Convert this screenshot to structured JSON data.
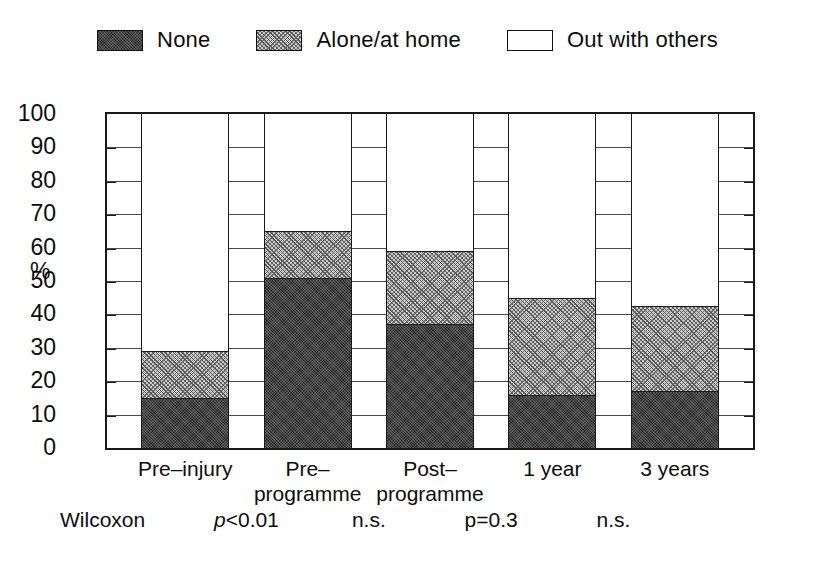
{
  "legend": {
    "items": [
      {
        "label": "None",
        "swatch": "dark-dotted-swatch",
        "fill": "fill-none"
      },
      {
        "label": "Alone/at home",
        "swatch": "hatched-swatch",
        "fill": "fill-alone"
      },
      {
        "label": "Out with others",
        "swatch": "white-swatch",
        "fill": "fill-out"
      }
    ]
  },
  "axis": {
    "ylabel": "%",
    "yticks": [
      "0",
      "10",
      "20",
      "30",
      "40",
      "50",
      "60",
      "70",
      "80",
      "90",
      "100"
    ],
    "categories": [
      "Pre–injury",
      "Pre–\nprogramme",
      "Post–\nprogramme",
      "1 year",
      "3 years"
    ]
  },
  "stats": {
    "title": "Wilcoxon",
    "values": [
      "p<0.01",
      "n.s.",
      "p=0.3",
      "n.s."
    ],
    "italic_flags": [
      true,
      false,
      false,
      false
    ]
  },
  "colors": {
    "none": "#2e2e2e",
    "alone": "#c9c9c9",
    "out": "#ffffff",
    "axis": "#1a1a1a"
  },
  "chart_data": {
    "type": "bar",
    "title": "",
    "subtitle": "",
    "xlabel": "",
    "ylabel": "%",
    "ylim": [
      0,
      100
    ],
    "yticks": [
      0,
      10,
      20,
      30,
      40,
      50,
      60,
      70,
      80,
      90,
      100
    ],
    "grid": "horizontal ticks shown only in gaps between bars",
    "legend_position": "top-center",
    "stacked": true,
    "categories": [
      "Pre–injury",
      "Pre–programme",
      "Post–programme",
      "1 year",
      "3 years"
    ],
    "series": [
      {
        "name": "None",
        "values": [
          15,
          51,
          37,
          16,
          17
        ]
      },
      {
        "name": "Alone/at home",
        "values": [
          14,
          14,
          22,
          29,
          25.5
        ]
      },
      {
        "name": "Out with others",
        "values": [
          71,
          35,
          41,
          55,
          57.5
        ]
      }
    ],
    "cumulative_tops": [
      {
        "name": "None",
        "values": [
          15,
          51,
          37,
          16,
          17
        ]
      },
      {
        "name": "Alone/at home",
        "values": [
          29,
          65,
          59,
          45,
          42.5
        ]
      },
      {
        "name": "Total",
        "values": [
          100,
          100,
          100,
          100,
          100
        ]
      }
    ],
    "annotations": [
      {
        "text": "Wilcoxon",
        "between": null
      },
      {
        "text": "p<0.01",
        "between": [
          "Pre–injury",
          "Pre–programme"
        ]
      },
      {
        "text": "n.s.",
        "between": [
          "Pre–programme",
          "Post–programme"
        ]
      },
      {
        "text": "p=0.3",
        "between": [
          "Post–programme",
          "1 year"
        ]
      },
      {
        "text": "n.s.",
        "between": [
          "1 year",
          "3 years"
        ]
      }
    ]
  }
}
